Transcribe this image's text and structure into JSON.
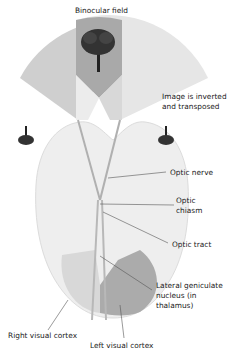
{
  "diagram": {
    "title": "Binocular field",
    "labels": {
      "image_note_line1": "Image is inverted",
      "image_note_line2": "and transposed",
      "optic_nerve": "Optic nerve",
      "optic_chiasm_line1": "Optic",
      "optic_chiasm_line2": "chiasm",
      "optic_tract": "Optic tract",
      "lgn_line1": "Lateral geniculate",
      "lgn_line2": "nucleus (in",
      "lgn_line3": "thalamus)",
      "right_visual_cortex": "Right visual cortex",
      "left_visual_cortex": "Left visual cortex"
    },
    "colors": {
      "left_field": "#c8c8c8",
      "right_field": "#e4e4e4",
      "binocular_overlap": "#a8a8a8",
      "brain": "#ececec",
      "right_cortex": "#d6d6d6",
      "left_cortex": "#a9a9a9",
      "leader_line": "#555555"
    }
  }
}
